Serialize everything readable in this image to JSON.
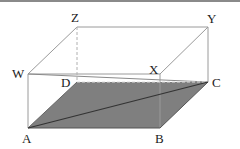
{
  "diagram": {
    "type": "cuboid",
    "labels": {
      "A": "A",
      "B": "B",
      "C": "C",
      "D": "D",
      "W": "W",
      "X": "X",
      "Y": "Y",
      "Z": "Z"
    },
    "colors": {
      "edge": "#9a9a9a",
      "dark_edge": "#444444",
      "shade": "#7f7f7f",
      "label": "#222222",
      "hidden_edge": "#b0b0b0"
    }
  }
}
